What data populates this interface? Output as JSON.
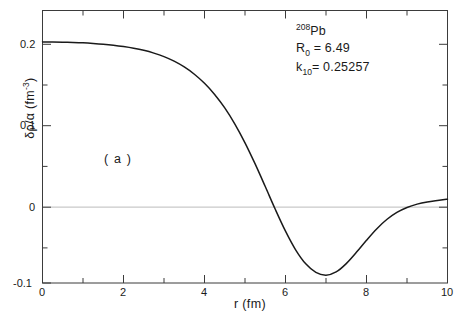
{
  "figure": {
    "panel_label": "( a )",
    "background_color": "#ffffff",
    "curve_color": "#1a1a1a",
    "axis_color": "#3b3b3b",
    "zeroline_color": "#c9c9c9"
  },
  "annotations": {
    "nuclide_mass": "208",
    "nuclide_symbol": "Pb",
    "r0_name": "R",
    "r0_sub": "0",
    "r0_eq": "= 6.49",
    "k10_name": "k",
    "k10_sub": "10",
    "k10_eq": "= 0.25257"
  },
  "axes": {
    "xlabel_symbol": "r",
    "xlabel_unit": "(fm)",
    "xlabel_full": "r (fm)",
    "ylabel_full": "δρ/α  (fm",
    "ylabel_exp": "-3",
    "ylabel_tail": ")",
    "x_ticklabels": [
      "0",
      "2",
      "4",
      "6",
      "8",
      "10"
    ],
    "y_ticklabels": [
      "0.2",
      "0.1",
      "0",
      "-0.1"
    ]
  },
  "chart_data": {
    "type": "line",
    "title": "",
    "subtitle": "",
    "xlabel": "r (fm)",
    "ylabel": "δρ/α (fm^-3)",
    "xlim": [
      0,
      10
    ],
    "ylim": [
      -0.1,
      0.23
    ],
    "xticks": [
      0,
      2,
      4,
      6,
      8,
      10
    ],
    "xticks_minor_step": 1,
    "yticks": [
      0.2,
      0.1,
      0,
      -0.1
    ],
    "yticks_minor_step": 0.05,
    "grid": false,
    "legend": false,
    "zero_line": true,
    "annotations": [
      "208Pb",
      "R_0 = 6.49",
      "k_10 = 0.25257",
      "( a )"
    ],
    "series": [
      {
        "name": "δρ/α",
        "x": [
          0.0,
          0.25,
          0.5,
          0.75,
          1.0,
          1.25,
          1.5,
          1.75,
          2.0,
          2.25,
          2.5,
          2.75,
          3.0,
          3.25,
          3.5,
          3.75,
          4.0,
          4.25,
          4.5,
          4.75,
          5.0,
          5.25,
          5.5,
          5.75,
          6.0,
          6.25,
          6.5,
          6.75,
          7.0,
          7.25,
          7.5,
          7.75,
          8.0,
          8.25,
          8.5,
          8.75,
          9.0,
          9.25,
          9.5,
          9.75,
          10.0
        ],
        "y": [
          0.192,
          0.1919,
          0.1917,
          0.1913,
          0.1908,
          0.1901,
          0.1892,
          0.188,
          0.1864,
          0.1844,
          0.1818,
          0.1784,
          0.1741,
          0.1686,
          0.1616,
          0.1528,
          0.1418,
          0.1283,
          0.112,
          0.0925,
          0.0698,
          0.0442,
          0.0168,
          -0.011,
          -0.0372,
          -0.0598,
          -0.0768,
          -0.0872,
          -0.0905,
          -0.0866,
          -0.0765,
          -0.0629,
          -0.0482,
          -0.0345,
          -0.0231,
          -0.0145,
          -0.0085,
          -0.0045,
          -0.0018,
          0.0,
          0.0015
        ]
      }
    ],
    "key_points": {
      "value_at_origin": 0.192,
      "zero_crossing_r": 5.85,
      "minimum_r": 6.95,
      "minimum_value": -0.0907,
      "value_at_r10": 0.0015
    }
  }
}
